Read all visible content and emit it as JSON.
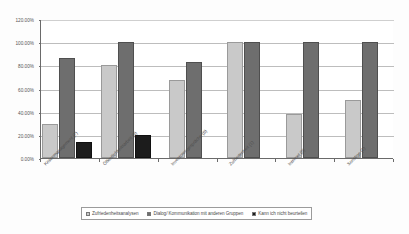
{
  "chart_data": {
    "type": "bar",
    "title": "",
    "subtitle": "",
    "xlabel": "",
    "ylabel": "",
    "ylim": [
      0,
      120
    ],
    "ytick_values": [
      0,
      20,
      40,
      60,
      80,
      100,
      120
    ],
    "ytick_labels": [
      "0.00%",
      "20.00%",
      "40.00%",
      "60.00%",
      "80.00%",
      "100.00%",
      "120.00%"
    ],
    "grid": true,
    "grid_axis": "y",
    "legend_position": "bottom",
    "orientation": "vertical",
    "categories": [
      "Krisenmanagement (7)",
      "Öffentlichkeitsarbeit (5)",
      "Investorengespräche (6)",
      "Zufriedenheit (1)",
      "Internet (8)",
      "Sonstige (2)"
    ],
    "series": [
      {
        "name": "Zufriedenheitsanalysen",
        "color": "#c9c9c9",
        "values": [
          29,
          80,
          67,
          100,
          38,
          50
        ]
      },
      {
        "name": "Dialog/ Kommunikation mit anderen Gruppen",
        "color": "#6e6e6e",
        "values": [
          86,
          100,
          83,
          100,
          100,
          100
        ]
      },
      {
        "name": "Kann ich nicht beurteilen",
        "color": "#1c1c1c",
        "values": [
          14,
          20,
          null,
          null,
          null,
          null
        ]
      }
    ]
  }
}
